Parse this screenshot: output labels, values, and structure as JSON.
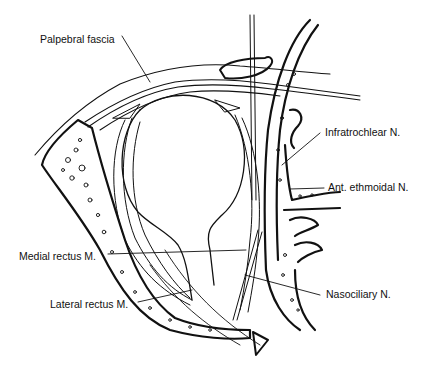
{
  "figure": {
    "labels": [
      {
        "id": "palpebral-fascia",
        "text": "Palpebral fascia"
      },
      {
        "id": "infratrochlear-n",
        "text": "Infratrochlear N."
      },
      {
        "id": "ant-ethmoidal-n",
        "text": "Ant. ethmoidal N."
      },
      {
        "id": "medial-rectus-m",
        "text": "Medial rectus M."
      },
      {
        "id": "lateral-rectus-m",
        "text": "Lateral rectus M."
      },
      {
        "id": "nasociliary-n",
        "text": "Nasociliary N."
      }
    ],
    "colors": {
      "ink": "#111111",
      "background": "#ffffff"
    }
  }
}
